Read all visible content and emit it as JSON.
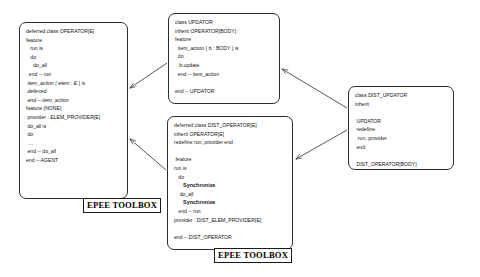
{
  "diagram": {
    "line_color": "#2c2c2c",
    "background": "#ffffff"
  },
  "boxes": {
    "operator": {
      "name": "OPERATOR class box",
      "lines": [
        {
          "text": "deferred class OPERATOR[E]",
          "style": "plain"
        },
        {
          "text": "feature",
          "style": "plain"
        },
        {
          "text": "   run is",
          "style": "plain"
        },
        {
          "text": "   do",
          "style": "plain"
        },
        {
          "text": "     do_all",
          "style": "plain"
        },
        {
          "text": "  end -- run",
          "style": "plain"
        },
        {
          "text": " item_action ( elem : E ) is",
          "style": "italic"
        },
        {
          "text": " deferred",
          "style": "italic"
        },
        {
          "text": " end -- item_action",
          "style": "italic"
        },
        {
          "text": "feature {NONE}",
          "style": "plain"
        },
        {
          "text": " provider : ELEM_PROVIDER[E]",
          "style": "plain"
        },
        {
          "text": " do_all is",
          "style": "plain"
        },
        {
          "text": " do",
          "style": "plain"
        },
        {
          "text": "  ...",
          "style": "italic"
        },
        {
          "text": " end -- do_all",
          "style": "plain"
        },
        {
          "text": "end -- AGENT",
          "style": "plain"
        }
      ]
    },
    "updator": {
      "name": "UPDATOR class box",
      "lines": [
        {
          "text": "class UPDATOR",
          "style": "plain"
        },
        {
          "text": "inherit OPERATOR[BODY]",
          "style": "plain"
        },
        {
          "text": "feature",
          "style": "plain"
        },
        {
          "text": "  item_action ( b : BODY ) is",
          "style": "plain"
        },
        {
          "text": "  do",
          "style": "plain"
        },
        {
          "text": "   b.update",
          "style": "plain"
        },
        {
          "text": "  end -- item_action",
          "style": "plain"
        },
        {
          "text": "",
          "style": "blank"
        },
        {
          "text": "end -- UPDATOR",
          "style": "plain"
        }
      ]
    },
    "dist_operator": {
      "name": "DIST_OPERATOR class box",
      "lines": [
        {
          "text": "deferred class DIST_OPERATOR[E]",
          "style": "plain"
        },
        {
          "text": "inherit OPERATOR[E]",
          "style": "plain"
        },
        {
          "text": "redefine run, provider end",
          "style": "plain"
        },
        {
          "text": "",
          "style": "blank"
        },
        {
          "text": " feature",
          "style": "plain"
        },
        {
          "text": "run is",
          "style": "plain"
        },
        {
          "text": "   do",
          "style": "plain"
        },
        {
          "text": "      Synchronize",
          "style": "bold"
        },
        {
          "text": "    do_all",
          "style": "plain"
        },
        {
          "text": "      Synchronize",
          "style": "bold"
        },
        {
          "text": "   end -- run",
          "style": "plain"
        },
        {
          "text": "provider : DIST_ELEM_PROVIDER[E]",
          "style": "plain"
        },
        {
          "text": "",
          "style": "blank"
        },
        {
          "text": "end -- DIST_OPERATOR",
          "style": "plain"
        }
      ]
    },
    "dist_updator": {
      "name": "DIST_UPDATOR class box",
      "lines": [
        {
          "text": "class DIST_UPDATOR",
          "style": "plain"
        },
        {
          "text": "inherit",
          "style": "plain"
        },
        {
          "text": "",
          "style": "blank"
        },
        {
          "text": " UPDATOR",
          "style": "plain"
        },
        {
          "text": " redefine",
          "style": "plain"
        },
        {
          "text": "  run, provider",
          "style": "plain"
        },
        {
          "text": " end",
          "style": "plain"
        },
        {
          "text": "",
          "style": "blank"
        },
        {
          "text": " DIST_OPERATOR[BODY]",
          "style": "plain"
        },
        {
          "text": "end -- DIST_UPDATOR",
          "style": "plain"
        }
      ]
    }
  },
  "labels": {
    "toolbox_left": "EPEE TOOLBOX",
    "toolbox_right": "EPEE TOOLBOX"
  },
  "arrows": [
    {
      "name": "updator-to-operator",
      "from": "UPDATOR",
      "to": "OPERATOR"
    },
    {
      "name": "dist-operator-to-operator",
      "from": "DIST_OPERATOR",
      "to": "OPERATOR"
    },
    {
      "name": "dist-updator-to-updator",
      "from": "DIST_UPDATOR",
      "to": "UPDATOR"
    },
    {
      "name": "dist-updator-to-dist-operator",
      "from": "DIST_UPDATOR",
      "to": "DIST_OPERATOR"
    }
  ]
}
